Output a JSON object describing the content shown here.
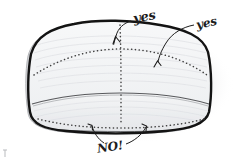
{
  "illustration": {
    "title": "Hand-drawn cushion seam annotation sketch",
    "background_color": "#ffffff",
    "object": {
      "name": "upholstered cushion block",
      "fill_color": "#f2f3f4",
      "outline_color": "#1a1a1a",
      "shadow_color": "#c9cacc",
      "grain_color": "#d8dade",
      "seam_color": "#3a3a3a"
    }
  },
  "annotations": [
    {
      "id": "yes-top",
      "text": "yes",
      "points_to": "vertical center seam on top face",
      "verdict": "approved"
    },
    {
      "id": "yes-right",
      "text": "yes",
      "points_to": "horizontal seam on top face",
      "verdict": "approved"
    },
    {
      "id": "no-bottom",
      "text": "NO!",
      "points_to": "lower front dotted seam line",
      "verdict": "rejected"
    }
  ]
}
